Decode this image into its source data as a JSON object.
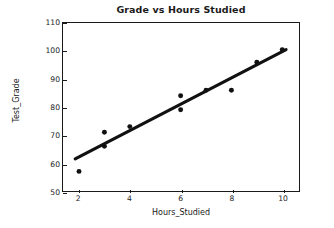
{
  "chart_data": {
    "type": "scatter",
    "title": "Grade vs Hours Studied",
    "xlabel": "Hours_Studied",
    "ylabel": "Test_Grade",
    "xlim": [
      1.37,
      10.66
    ],
    "ylim": [
      50,
      110
    ],
    "xticks": [
      2,
      4,
      6,
      8,
      10
    ],
    "yticks": [
      50,
      60,
      70,
      80,
      90,
      100,
      110
    ],
    "grid": false,
    "legend": null,
    "marker_color": "#111111",
    "line_color": "#111111",
    "frame_color": "#1a1a1a",
    "background": "#ffffff",
    "series": [
      {
        "name": "Observations",
        "type": "scatter",
        "x": [
          2,
          3,
          3,
          4,
          6,
          6,
          7,
          8,
          9,
          10
        ],
        "y": [
          57,
          71,
          66,
          73,
          84,
          79,
          86,
          86,
          96,
          100.5
        ]
      },
      {
        "name": "Regression line",
        "type": "line",
        "x": [
          1.85,
          10.15
        ],
        "y": [
          61.5,
          100.5
        ]
      }
    ]
  }
}
